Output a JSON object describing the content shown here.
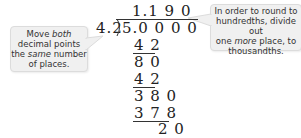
{
  "callouts": {
    "left": {
      "line1_pre": "Move ",
      "line1_em": "both",
      "line2": "decimal points",
      "line3_pre": "the ",
      "line3_em": "same",
      "line3_post": " number",
      "line4": "of places."
    },
    "right": {
      "line1": "In order to round to",
      "line2": "hundredths, divide out",
      "line3_pre": "one ",
      "line3_em": "more",
      "line3_post": " place, to",
      "line4": "thousandths."
    }
  },
  "division": {
    "quotient": "1.1 9 0",
    "divisor": "4.2",
    "dividend": "5.0 0 0 0",
    "steps": [
      {
        "value": "4 2",
        "underline": true
      },
      {
        "value": "8 0",
        "underline": false
      },
      {
        "value": "4 2",
        "underline": true
      },
      {
        "value": "3 8 0",
        "underline": false
      },
      {
        "value": "3 7 8",
        "underline": true
      },
      {
        "value": "2 0",
        "underline": false
      }
    ]
  }
}
